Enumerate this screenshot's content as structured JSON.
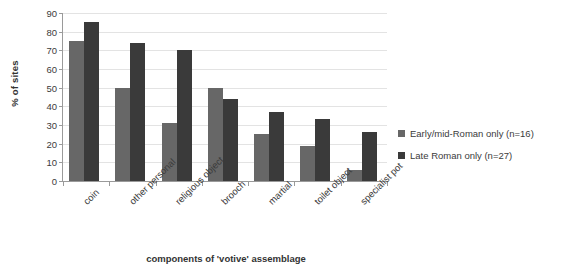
{
  "chart_data": {
    "type": "bar",
    "title": "",
    "xlabel": "components of 'votive' assemblage",
    "ylabel": "% of sites",
    "ylim": [
      0,
      90
    ],
    "ytick_step": 10,
    "yticks": [
      0,
      10,
      20,
      30,
      40,
      50,
      60,
      70,
      80,
      90
    ],
    "grid": true,
    "legend_position": "right",
    "categories": [
      "coin",
      "other personal",
      "religious object",
      "brooch",
      "martial",
      "toilet object",
      "specialist pot"
    ],
    "series": [
      {
        "name": "Early/mid-Roman only (n=16)",
        "color": "#676767",
        "values": [
          75,
          50,
          31,
          50,
          25,
          19,
          6
        ]
      },
      {
        "name": "Late Roman only (n=27)",
        "color": "#3a3a3a",
        "values": [
          85,
          74,
          70,
          44,
          37,
          33,
          26
        ]
      }
    ]
  },
  "legend": {
    "items": [
      {
        "label": "Early/mid-Roman only (n=16)",
        "color": "#676767"
      },
      {
        "label": "Late Roman only (n=27)",
        "color": "#3a3a3a"
      }
    ]
  },
  "colors": {
    "series_early": "#676767",
    "series_late": "#3a3a3a",
    "gridline": "#e3e3e3",
    "axis": "#9a9a9a",
    "text": "#3b3b3b",
    "background": "#ffffff"
  }
}
